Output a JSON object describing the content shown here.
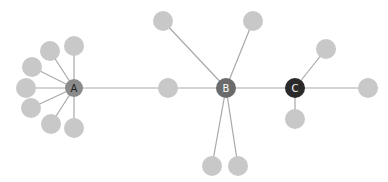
{
  "diagram": {
    "type": "network-graph",
    "colors": {
      "edge": "#a8a8a8",
      "leaf": "#c8c8c8",
      "hub_a": "#8b8b8b",
      "hub_b": "#6b6b6b",
      "hub_c": "#2a2a2a",
      "label_light": "#ffffff",
      "label_dark": "#222222"
    },
    "hubs": [
      {
        "id": "A",
        "label": "A",
        "x": 74,
        "y": 88,
        "r": 9,
        "fill": "#8b8b8b",
        "labelColor": "#222222"
      },
      {
        "id": "B",
        "label": "B",
        "x": 226,
        "y": 88,
        "r": 10,
        "fill": "#6b6b6b",
        "labelColor": "#ffffff"
      },
      {
        "id": "C",
        "label": "C",
        "x": 295,
        "y": 88,
        "r": 10,
        "fill": "#2a2a2a",
        "labelColor": "#ffffff"
      }
    ],
    "leaves": [
      {
        "id": "a1",
        "x": 74,
        "y": 46,
        "r": 10
      },
      {
        "id": "a2",
        "x": 50,
        "y": 51,
        "r": 10
      },
      {
        "id": "a3",
        "x": 32,
        "y": 67,
        "r": 10
      },
      {
        "id": "a4",
        "x": 26,
        "y": 88,
        "r": 10
      },
      {
        "id": "a5",
        "x": 31,
        "y": 108,
        "r": 10
      },
      {
        "id": "a6",
        "x": 51,
        "y": 124,
        "r": 10
      },
      {
        "id": "a7",
        "x": 74,
        "y": 128,
        "r": 10
      },
      {
        "id": "m1",
        "x": 168,
        "y": 88,
        "r": 10
      },
      {
        "id": "b1",
        "x": 163,
        "y": 21,
        "r": 10
      },
      {
        "id": "b2",
        "x": 253,
        "y": 21,
        "r": 10
      },
      {
        "id": "b3",
        "x": 212,
        "y": 166,
        "r": 10
      },
      {
        "id": "b4",
        "x": 238,
        "y": 166,
        "r": 10
      },
      {
        "id": "c1",
        "x": 326,
        "y": 49,
        "r": 10
      },
      {
        "id": "c2",
        "x": 368,
        "y": 88,
        "r": 10
      },
      {
        "id": "c3",
        "x": 295,
        "y": 119,
        "r": 10
      }
    ],
    "edges": [
      [
        "A",
        "a1"
      ],
      [
        "A",
        "a2"
      ],
      [
        "A",
        "a3"
      ],
      [
        "A",
        "a4"
      ],
      [
        "A",
        "a5"
      ],
      [
        "A",
        "a6"
      ],
      [
        "A",
        "a7"
      ],
      [
        "A",
        "m1"
      ],
      [
        "m1",
        "B"
      ],
      [
        "B",
        "b1"
      ],
      [
        "B",
        "b2"
      ],
      [
        "B",
        "b3"
      ],
      [
        "B",
        "b4"
      ],
      [
        "B",
        "C"
      ],
      [
        "C",
        "c1"
      ],
      [
        "C",
        "c2"
      ],
      [
        "C",
        "c3"
      ]
    ]
  }
}
